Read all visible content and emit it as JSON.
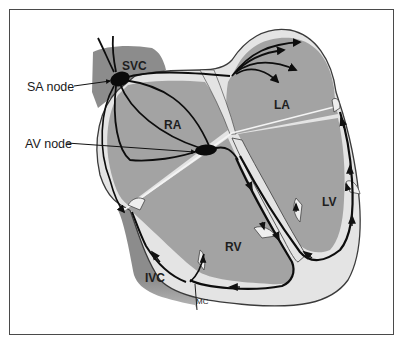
{
  "figure": {
    "colors": {
      "chamber_fill": "#a3a3a3",
      "vessel_fill": "#8c8c8c",
      "wall_fill": "#e4e4e4",
      "outline": "#3a3a3a",
      "conduction_path": "#0d0d0d",
      "background": "#ffffff"
    }
  },
  "labels": {
    "svc": "SVC",
    "ivc": "IVC",
    "ra": "RA",
    "la": "LA",
    "rv": "RV",
    "lv": "LV",
    "mc": "MC",
    "sa_node": "SA node",
    "av_node": "AV node"
  },
  "structures": [
    {
      "id": "svc",
      "name": "Superior vena cava"
    },
    {
      "id": "ivc",
      "name": "Inferior vena cava"
    },
    {
      "id": "ra",
      "name": "Right atrium"
    },
    {
      "id": "la",
      "name": "Left atrium"
    },
    {
      "id": "rv",
      "name": "Right ventricle"
    },
    {
      "id": "lv",
      "name": "Left ventricle"
    },
    {
      "id": "sa_node",
      "name": "Sinoatrial node"
    },
    {
      "id": "av_node",
      "name": "Atrioventricular node"
    }
  ]
}
